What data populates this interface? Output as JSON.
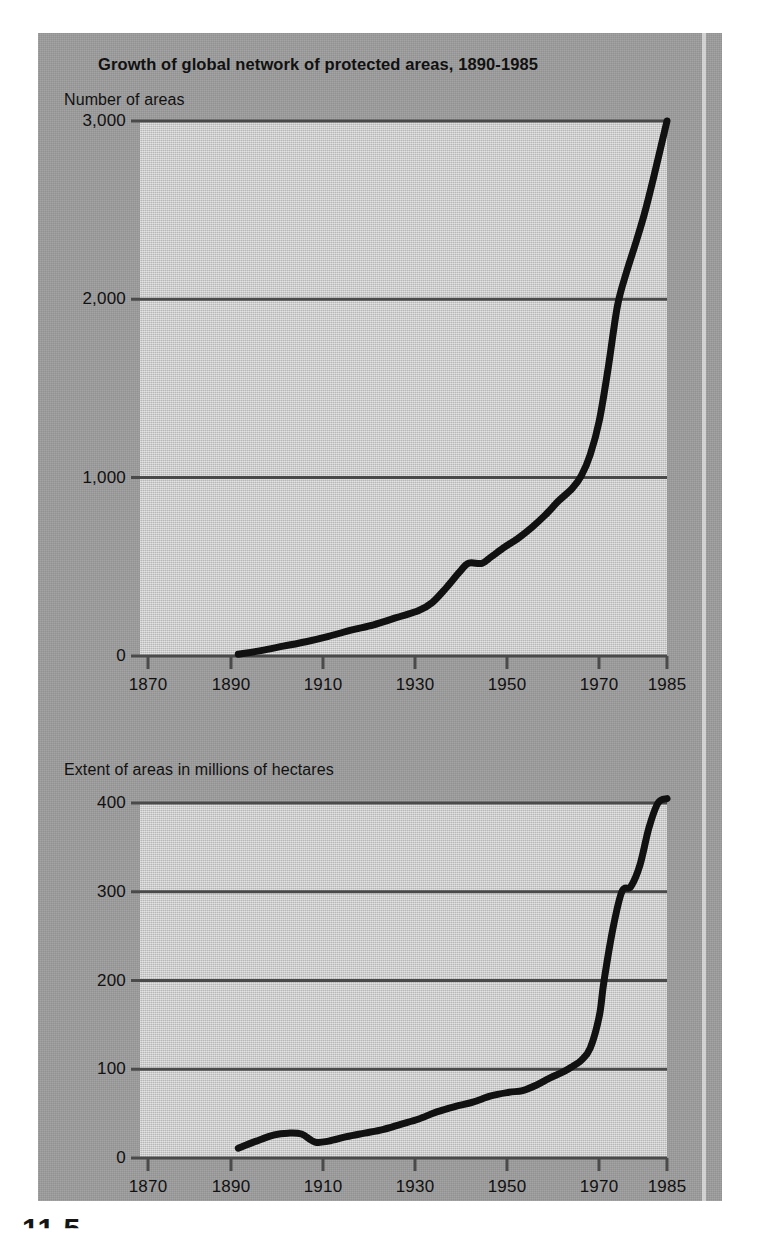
{
  "title": "Growth of global network of protected areas, 1890-1985",
  "figure_caption": "11.5",
  "charts": {
    "top": {
      "caption": "Number of areas",
      "ytick_labels": [
        "3,000",
        "2,000",
        "1,000",
        "0"
      ],
      "xtick_labels": [
        "1870",
        "1890",
        "1910",
        "1930",
        "1950",
        "1970",
        "1985"
      ]
    },
    "bottom": {
      "caption": "Extent of areas in millions of hectares",
      "ytick_labels": [
        "400",
        "300",
        "200",
        "100",
        "0"
      ],
      "xtick_labels": [
        "1870",
        "1890",
        "1910",
        "1930",
        "1950",
        "1970",
        "1985"
      ]
    }
  },
  "colors": {
    "page_background": "#ffffff",
    "panel_background": "#9c9c9c",
    "plot_background": "#c9c9c9",
    "line": "#111111",
    "gridline": "#4a4a4a",
    "text": "#111111"
  },
  "chart_data": [
    {
      "type": "line",
      "id": "number-of-areas",
      "title": "Growth of global network of protected areas, 1890-1985",
      "subtitle": "Number of areas",
      "xlabel": "",
      "ylabel": "Number of areas",
      "xlim": [
        1870,
        1985
      ],
      "ylim": [
        0,
        3000
      ],
      "xticks": [
        1870,
        1890,
        1910,
        1930,
        1950,
        1970,
        1985
      ],
      "yticks": [
        0,
        1000,
        2000,
        3000
      ],
      "grid": true,
      "legend": "none",
      "x": [
        1890,
        1895,
        1900,
        1905,
        1910,
        1915,
        1920,
        1925,
        1930,
        1933,
        1936,
        1939,
        1941,
        1944,
        1946,
        1949,
        1952,
        1955,
        1958,
        1961,
        1964,
        1966,
        1968,
        1970,
        1972,
        1974,
        1976,
        1978,
        1980,
        1982,
        1985
      ],
      "y": [
        10,
        30,
        55,
        80,
        110,
        145,
        175,
        215,
        255,
        300,
        380,
        470,
        520,
        520,
        555,
        610,
        660,
        720,
        790,
        870,
        940,
        1010,
        1130,
        1320,
        1620,
        1960,
        2150,
        2310,
        2480,
        2680,
        3000
      ]
    },
    {
      "type": "line",
      "id": "extent-of-areas",
      "title": "Growth of global network of protected areas, 1890-1985",
      "subtitle": "Extent of areas in millions of hectares",
      "xlabel": "",
      "ylabel": "Extent of areas in millions of hectares",
      "xlim": [
        1870,
        1985
      ],
      "ylim": [
        0,
        400
      ],
      "xticks": [
        1870,
        1890,
        1910,
        1930,
        1950,
        1970,
        1985
      ],
      "yticks": [
        0,
        100,
        200,
        300,
        400
      ],
      "grid": true,
      "legend": "none",
      "x": [
        1890,
        1894,
        1898,
        1901,
        1904,
        1907,
        1910,
        1914,
        1918,
        1922,
        1926,
        1930,
        1934,
        1938,
        1942,
        1946,
        1950,
        1953,
        1956,
        1959,
        1962,
        1964,
        1966,
        1968,
        1970,
        1971,
        1973,
        1975,
        1977,
        1979,
        1981,
        1983,
        1985
      ],
      "y": [
        11,
        19,
        26,
        28,
        27,
        18,
        19,
        24,
        28,
        32,
        38,
        44,
        52,
        58,
        63,
        70,
        74,
        76,
        82,
        90,
        97,
        103,
        110,
        124,
        160,
        198,
        258,
        300,
        306,
        330,
        372,
        400,
        405
      ]
    }
  ]
}
